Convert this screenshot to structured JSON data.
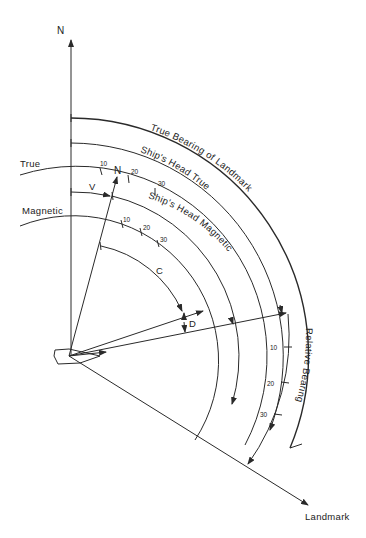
{
  "diagram": {
    "labels": {
      "north": "N",
      "true": "True",
      "magnetic": "Magnetic",
      "variation": "V",
      "compass_course": "C",
      "deviation": "D",
      "landmark": "Landmark",
      "compass_north": "N"
    },
    "arc_labels": {
      "true_bearing_of_landmark": "True Bearing of Landmark",
      "ships_head_true": "Ship's Head True",
      "ships_head_magnetic": "Ship's Head Magnetic",
      "relative_bearing": "Relative Bearing"
    },
    "true_scale_ticks": [
      "10",
      "20",
      "30"
    ],
    "magnetic_scale_ticks": [
      "10",
      "20",
      "30"
    ],
    "relative_scale_ticks": [
      "10",
      "20",
      "30"
    ]
  }
}
